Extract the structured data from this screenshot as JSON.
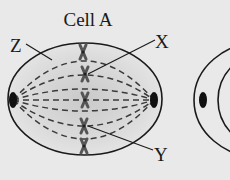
{
  "diagram": {
    "title": "Cell A",
    "labels": {
      "z": "Z",
      "x": "X",
      "y": "Y"
    },
    "colors": {
      "background": "#e9e9e9",
      "outline": "#1a1a1a",
      "cytoplasm_center": "#cfcfcf",
      "chromosome": "#555555",
      "centrosome": "#111111"
    },
    "cells": [
      {
        "name": "Cell A",
        "stage": "metaphase",
        "chromosome_count": 5
      },
      {
        "name": "second cell (partially visible)"
      }
    ]
  }
}
